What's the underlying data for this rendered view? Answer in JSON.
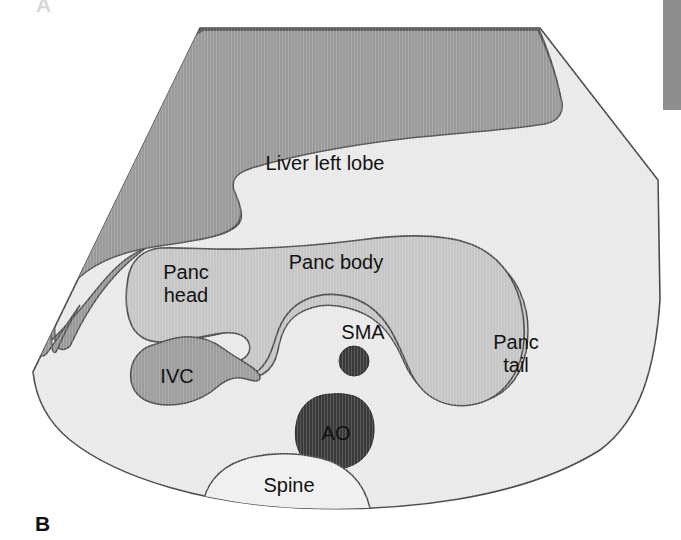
{
  "figure": {
    "panel_letter": "B",
    "panel_letter_ghost": "A",
    "type": "transverse abdominal ultrasound schematic"
  },
  "labels": {
    "liver": "Liver left lobe",
    "panc_head_line1": "Panc",
    "panc_head_line2": "head",
    "panc_body": "Panc body",
    "panc_tail_line1": "Panc",
    "panc_tail_line2": "tail",
    "ivc": "IVC",
    "sma": "SMA",
    "ao": "AO",
    "spine": "Spine"
  },
  "colors": {
    "page_background": "#ffffff",
    "sector_fill": "#e9e9e9",
    "sector_stroke": "#4a4a4a",
    "liver_fill": "#9a9a9a",
    "liver_stroke": "#535353",
    "pancreas_fill": "#c6c6c6",
    "pancreas_stroke": "#4e4e4e",
    "ivc_fill": "#9d9d9d",
    "ivc_stroke": "#4e4e4e",
    "vessel_dark_fill": "#3a3a3a",
    "vessel_dark_stroke": "#2a2a2a",
    "spine_fill": "#efefef",
    "spine_stroke": "#4a4a4a",
    "artifact_bar": "#8e8e8e",
    "text": "#131313"
  },
  "structures": [
    {
      "name": "sector-field",
      "label": null,
      "description": "ultrasound sector field of view outline"
    },
    {
      "name": "liver-left-lobe",
      "label": "Liver left lobe",
      "shade": "dark gray"
    },
    {
      "name": "pancreas",
      "label": "Panc head / Panc body / Panc tail",
      "shade": "light-mid gray"
    },
    {
      "name": "inferior-vena-cava",
      "label": "IVC",
      "shade": "mid gray"
    },
    {
      "name": "superior-mesenteric-artery",
      "label": "SMA",
      "shade": "very dark gray"
    },
    {
      "name": "aorta",
      "label": "AO",
      "shade": "very dark gray"
    },
    {
      "name": "vertebral-body",
      "label": "Spine",
      "shade": "white"
    }
  ],
  "label_positions": {
    "liver": {
      "x": 325,
      "y": 170
    },
    "panc_body": {
      "x": 336,
      "y": 269
    },
    "panc_head_line1": {
      "x": 186,
      "y": 279
    },
    "panc_head_line2": {
      "x": 186,
      "y": 302
    },
    "panc_tail_line1": {
      "x": 516,
      "y": 349
    },
    "panc_tail_line2": {
      "x": 516,
      "y": 372
    },
    "ivc": {
      "x": 177,
      "y": 383
    },
    "sma": {
      "x": 363,
      "y": 339
    },
    "ao": {
      "x": 336,
      "y": 440
    },
    "spine": {
      "x": 289,
      "y": 492
    }
  }
}
